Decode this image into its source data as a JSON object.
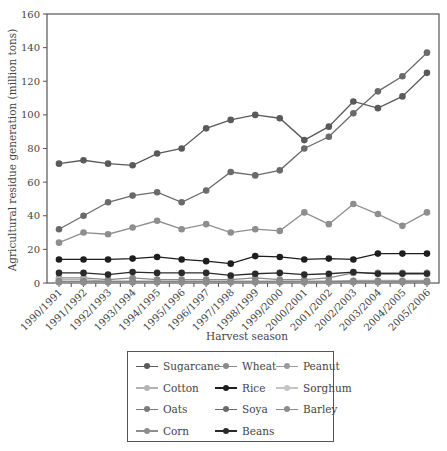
{
  "chart_data": {
    "type": "line",
    "title": "",
    "xlabel": "Harvest season",
    "ylabel": "Agricultural residue generation (million tons)",
    "ylim": [
      0,
      160
    ],
    "yticks": [
      0,
      20,
      40,
      60,
      80,
      100,
      120,
      140,
      160
    ],
    "grid": false,
    "legend_position": "bottom",
    "categories": [
      "1990/1991",
      "1991/1992",
      "1992/1993",
      "1993/1994",
      "1994/1995",
      "1995/1996",
      "1996/1997",
      "1997/1998",
      "1998/1999",
      "1999/2000",
      "2000/2001",
      "2001/2002",
      "2002/2003",
      "2003/2004",
      "2004/2005",
      "2005/2006"
    ],
    "series": [
      {
        "name": "Sugarcane",
        "color": "#5a5a5a",
        "values": [
          71,
          73,
          71,
          70,
          77,
          80,
          92,
          97,
          100,
          98,
          85,
          93,
          108,
          104,
          111,
          125
        ]
      },
      {
        "name": "Wheat",
        "color": "#8a8a8a",
        "values": [
          3,
          3,
          2,
          3,
          2,
          2,
          2,
          2,
          3,
          2,
          2,
          3,
          6,
          6,
          6,
          6
        ]
      },
      {
        "name": "Peanut",
        "color": "#9a9a9a",
        "values": [
          0.5,
          0.5,
          0.5,
          0.5,
          0.5,
          0.5,
          0.5,
          0.5,
          0.5,
          0.5,
          0.5,
          0.5,
          0.7,
          0.7,
          0.7,
          0.7
        ]
      },
      {
        "name": "Cotton",
        "color": "#b4b4b4",
        "values": [
          2,
          2,
          1,
          1,
          1,
          1,
          1,
          1,
          1,
          1,
          1,
          1,
          1.5,
          1.5,
          1.5,
          1.5
        ]
      },
      {
        "name": "Rice",
        "color": "#1e1e1e",
        "values": [
          14,
          14,
          14,
          14.5,
          15.5,
          14,
          13,
          11.5,
          16,
          15.5,
          14,
          14.5,
          14,
          17.5,
          17.5,
          17.5
        ]
      },
      {
        "name": "Sorghum",
        "color": "#c4c4c4",
        "values": [
          0.5,
          0.5,
          0.5,
          0.5,
          0.5,
          0.5,
          0.5,
          0.5,
          0.5,
          0.5,
          0.5,
          0.5,
          0.5,
          0.5,
          0.5,
          0.5
        ]
      },
      {
        "name": "Oats",
        "color": "#7a7a7a",
        "values": [
          1,
          1,
          1,
          1,
          1,
          1,
          1,
          1,
          1,
          1,
          1,
          1,
          1,
          1,
          1,
          1
        ]
      },
      {
        "name": "Soya",
        "color": "#6a6a6a",
        "values": [
          32,
          40,
          48,
          52,
          54,
          48,
          55,
          66,
          64,
          67,
          80,
          87,
          101,
          114,
          123,
          137
        ]
      },
      {
        "name": "Barley",
        "color": "#8c8c8c",
        "values": [
          0.5,
          0.5,
          0.5,
          0.5,
          0.5,
          0.5,
          0.5,
          0.5,
          0.5,
          0.5,
          0.5,
          0.5,
          0.5,
          0.5,
          0.5,
          0.5
        ]
      },
      {
        "name": "Corn",
        "color": "#8e8e8e",
        "values": [
          24,
          30,
          29,
          33,
          37,
          32,
          35,
          30,
          32,
          31,
          42,
          35,
          47,
          41,
          34,
          42
        ]
      },
      {
        "name": "Beans",
        "color": "#2a2a2a",
        "values": [
          6,
          6,
          5,
          6.5,
          6,
          6,
          6,
          4.5,
          5.5,
          6,
          5,
          5.5,
          6.5,
          5.5,
          5.5,
          5.5
        ]
      }
    ]
  },
  "legend": {
    "items": [
      "Sugarcane",
      "Wheat",
      "Peanut",
      "Cotton",
      "Rice",
      "Sorghum",
      "Oats",
      "Soya",
      "Barley",
      "Corn",
      "Beans"
    ]
  }
}
